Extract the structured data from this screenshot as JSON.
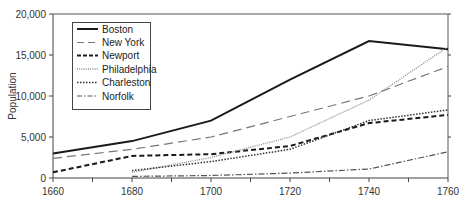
{
  "chart_data": {
    "type": "line",
    "title": "",
    "xlabel": "",
    "ylabel": "Population",
    "x": [
      1660,
      1680,
      1700,
      1720,
      1740,
      1760
    ],
    "xlim": [
      1660,
      1760
    ],
    "ylim": [
      0,
      20000
    ],
    "x_ticks": [
      "1660",
      "1680",
      "1700",
      "1720",
      "1740",
      "1760"
    ],
    "y_ticks": [
      "0",
      "5,000",
      "10,000",
      "15,000",
      "20,000"
    ],
    "grid": false,
    "legend_position": "upper-left",
    "series": [
      {
        "name": "Boston",
        "style": "solid",
        "x": [
          1660,
          1680,
          1700,
          1720,
          1740,
          1760
        ],
        "values": [
          3000,
          4500,
          7000,
          12000,
          16700,
          15700
        ]
      },
      {
        "name": "New York",
        "style": "long-dash",
        "x": [
          1660,
          1680,
          1700,
          1720,
          1740,
          1760
        ],
        "values": [
          2400,
          3500,
          5000,
          7500,
          10000,
          13600
        ]
      },
      {
        "name": "Newport",
        "style": "short-dash",
        "x": [
          1660,
          1680,
          1700,
          1720,
          1740,
          1760
        ],
        "values": [
          700,
          2700,
          2900,
          3900,
          6700,
          7700
        ]
      },
      {
        "name": "Philadelphia",
        "style": "fine-dot",
        "x": [
          1680,
          1700,
          1720,
          1740,
          1760
        ],
        "values": [
          700,
          2500,
          5000,
          9500,
          16000
        ]
      },
      {
        "name": "Charleston",
        "style": "dot",
        "x": [
          1680,
          1700,
          1720,
          1740,
          1760
        ],
        "values": [
          900,
          2000,
          3500,
          7000,
          8300
        ]
      },
      {
        "name": "Norfolk",
        "style": "dash-dot",
        "x": [
          1680,
          1700,
          1720,
          1740,
          1760
        ],
        "values": [
          200,
          300,
          600,
          1100,
          3200
        ]
      }
    ]
  },
  "legend": {
    "items": [
      {
        "label": "Boston"
      },
      {
        "label": "New York"
      },
      {
        "label": "Newport"
      },
      {
        "label": "Philadelphia"
      },
      {
        "label": "Charleston"
      },
      {
        "label": "Norfolk"
      }
    ]
  },
  "axes": {
    "ylabel": "Population",
    "x_ticks": [
      "1660",
      "1680",
      "1700",
      "1720",
      "1740",
      "1760"
    ],
    "y_ticks": [
      "0",
      "5,000",
      "10,000",
      "15,000",
      "20,000"
    ]
  }
}
